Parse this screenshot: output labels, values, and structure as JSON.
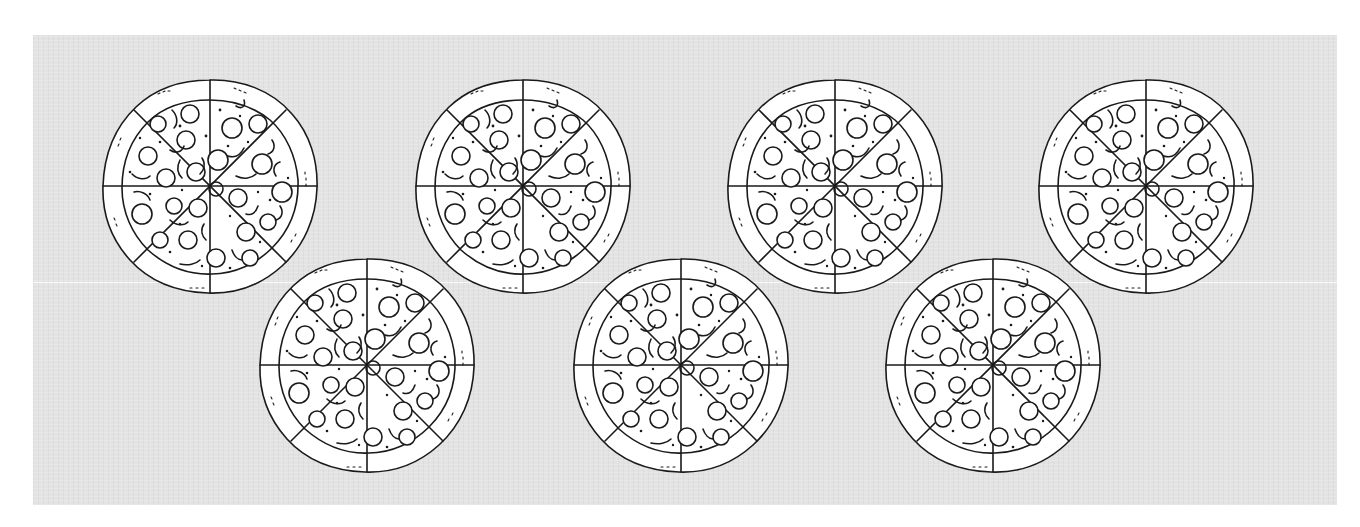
{
  "scene": {
    "description": "Seven line-drawn pepperoni pizzas, each cut into 8 slices, on a light gray textured backdrop",
    "background_color": "#e3e3e3",
    "outline_color": "#1a1a1a",
    "pizza_fill": "#ffffff",
    "pizza_count": 7,
    "slices_per_pizza": 8
  },
  "pizzas": [
    {
      "id": "pizza-1",
      "row": "top",
      "cx": 210,
      "cy": 186
    },
    {
      "id": "pizza-2",
      "row": "top",
      "cx": 523,
      "cy": 186
    },
    {
      "id": "pizza-3",
      "row": "top",
      "cx": 835,
      "cy": 186
    },
    {
      "id": "pizza-4",
      "row": "top",
      "cx": 1146,
      "cy": 186
    },
    {
      "id": "pizza-5",
      "row": "bottom",
      "cx": 367,
      "cy": 365
    },
    {
      "id": "pizza-6",
      "row": "bottom",
      "cx": 681,
      "cy": 365
    },
    {
      "id": "pizza-7",
      "row": "bottom",
      "cx": 993,
      "cy": 365
    }
  ]
}
